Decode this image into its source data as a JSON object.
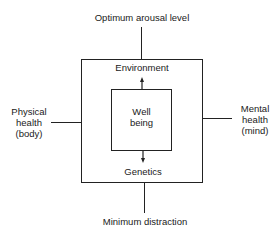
{
  "diagram": {
    "top_label": "Optimum arousal level",
    "bottom_label": "Minimum distraction",
    "left_label": [
      "Physical",
      "health",
      "(body)"
    ],
    "right_label": [
      "Mental",
      "health",
      "(mind)"
    ],
    "outer_top_label": "Environment",
    "outer_bottom_label": "Genetics",
    "center_label": [
      "Well",
      "being"
    ]
  }
}
